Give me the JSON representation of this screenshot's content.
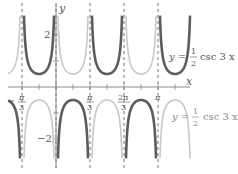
{
  "chart_data": {
    "type": "line",
    "title": "",
    "xlabel": "x",
    "ylabel": "y",
    "xlim": [
      -1.45,
      2.05
    ],
    "ylim": [
      -3.0,
      3.1
    ],
    "grid": false,
    "x_ticks": [
      {
        "value": -1.0472,
        "label_num": "π",
        "label_den": "3",
        "negative": true
      },
      {
        "value": 1.0472,
        "label_num": "π",
        "label_den": "3",
        "negative": false
      },
      {
        "value": 2.0944,
        "label_num": "2π",
        "label_den": "3",
        "negative": false
      },
      {
        "value": 3.1416,
        "label_num": "π",
        "label_den": "",
        "negative": false
      }
    ],
    "y_ticks": [
      {
        "value": 2,
        "label": "2"
      },
      {
        "value": -2,
        "label": "−2"
      }
    ],
    "asymptotes_x": [
      "-π/3",
      "0",
      "π/3",
      "2π/3",
      "π"
    ],
    "series": [
      {
        "name": "y = −(1/2) csc 3x",
        "label_prefix": "y =",
        "label_sign": "−",
        "label_num": "1",
        "label_den": "2",
        "label_suffix": "csc 3x",
        "color": "#5c5c5c",
        "coef": -0.5
      },
      {
        "name": "y = (1/2) csc 3x",
        "label_prefix": "y =",
        "label_sign": "",
        "label_num": "1",
        "label_den": "2",
        "label_suffix": "csc 3x",
        "color": "#c8c8c8",
        "coef": 0.5
      }
    ]
  },
  "labels": {
    "x_axis": "x",
    "y_axis": "y",
    "y_tick_pos": "2",
    "y_tick_neg": "−2",
    "tick_neg_pi3_num": "π",
    "tick_neg_pi3_den": "3",
    "tick_pi3_num": "π",
    "tick_pi3_den": "3",
    "tick_2pi3_num": "2π",
    "tick_2pi3_den": "3",
    "tick_pi": "π",
    "dark_label_y": "y =",
    "dark_label_num": "1",
    "dark_label_den": "2",
    "dark_label_fn": "csc 3 x",
    "light_label_y": "y =",
    "light_label_num": "1",
    "light_label_den": "2",
    "light_label_fn": "csc 3 x"
  }
}
